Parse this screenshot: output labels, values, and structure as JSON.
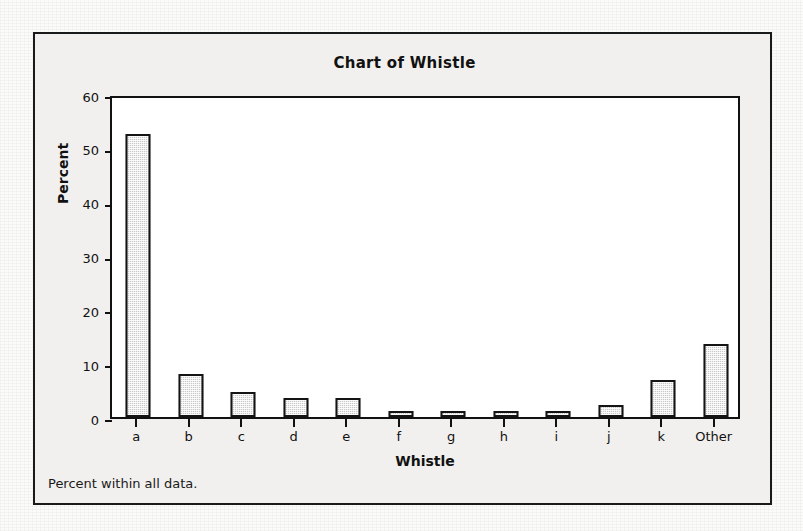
{
  "figure": {
    "title": "Chart of Whistle",
    "footnote": "Percent within all data."
  },
  "chart_data": {
    "type": "bar",
    "title": "Chart of Whistle",
    "xlabel": "Whistle",
    "ylabel": "Percent",
    "categories": [
      "a",
      "b",
      "c",
      "d",
      "e",
      "f",
      "g",
      "h",
      "i",
      "j",
      "k",
      "Other"
    ],
    "values": [
      52.6,
      8.0,
      4.7,
      3.6,
      3.6,
      1.1,
      1.1,
      1.1,
      1.1,
      2.2,
      6.8,
      13.5
    ],
    "ylim": [
      0,
      60
    ],
    "yticks": [
      0,
      10,
      20,
      30,
      40,
      50,
      60
    ],
    "ytick_labels": [
      "0",
      "10",
      "20",
      "30",
      "40",
      "50",
      "60"
    ],
    "grid": false,
    "legend": false,
    "bar_fill_color": "#c9c9c9",
    "bar_border_color": "#141414",
    "plot_background": "#ffffff",
    "figure_background": "#f1f0ee",
    "annotation": "Percent within all data."
  }
}
